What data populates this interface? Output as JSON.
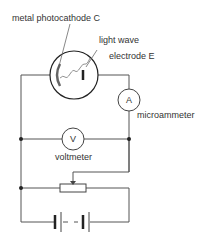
{
  "labels": {
    "photocathode": "metal photocathode C",
    "light": "light wave",
    "electrode": "electrode E",
    "ammeter_symbol": "A",
    "ammeter": "microammeter",
    "voltmeter_symbol": "V",
    "voltmeter": "voltmeter"
  },
  "colors": {
    "wire": "#555555",
    "tube_outline": "#222222",
    "cathode": "#666666"
  }
}
